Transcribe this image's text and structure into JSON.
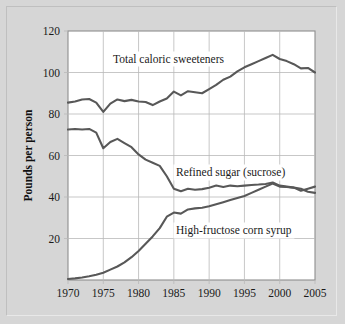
{
  "figure": {
    "background_color": "#d6d6d6",
    "plot_background_color": "#ffffff",
    "line_color": "#585858",
    "grid_color": "#b9b9b9",
    "frame_color": "#8e8e8e"
  },
  "axes": {
    "y_axis_title": "Pounds per person",
    "y_tick_labels": [
      "120",
      "100",
      "80",
      "60",
      "40",
      "20"
    ],
    "x_tick_labels": [
      "1970",
      "1975",
      "1980",
      "1985",
      "1990",
      "1995",
      "2000",
      "2005"
    ]
  },
  "series_labels": {
    "total": "Total caloric sweeteners",
    "sugar": "Refined sugar (sucrose)",
    "hfcs": "High-fructose corn syrup"
  },
  "chart_data": {
    "type": "line",
    "title": "",
    "xlabel": "",
    "ylabel": "Pounds per person",
    "xlim": [
      1970,
      2005
    ],
    "ylim": [
      0,
      120
    ],
    "grid": true,
    "legend_position": "inline-labels",
    "x_ticks": [
      1970,
      1975,
      1980,
      1985,
      1990,
      1995,
      2000,
      2005
    ],
    "y_ticks": [
      20,
      40,
      60,
      80,
      100,
      120
    ],
    "x": [
      1970,
      1971,
      1972,
      1973,
      1974,
      1975,
      1976,
      1977,
      1978,
      1979,
      1980,
      1981,
      1982,
      1983,
      1984,
      1985,
      1986,
      1987,
      1988,
      1989,
      1990,
      1991,
      1992,
      1993,
      1994,
      1995,
      1996,
      1997,
      1998,
      1999,
      2000,
      2001,
      2002,
      2003,
      2004,
      2005
    ],
    "series": [
      {
        "name": "Total caloric sweeteners",
        "values": [
          85.5,
          86.0,
          87.0,
          87.2,
          85.5,
          81.0,
          85.0,
          87.0,
          86.2,
          86.8,
          86.0,
          85.8,
          84.3,
          86.0,
          87.5,
          90.8,
          89.0,
          91.0,
          90.5,
          90.0,
          92.0,
          94.0,
          96.5,
          98.0,
          100.5,
          102.5,
          104.0,
          105.5,
          107.0,
          108.5,
          106.5,
          105.5,
          104.0,
          102.0,
          102.2,
          100.0
        ]
      },
      {
        "name": "Refined sugar (sucrose)",
        "values": [
          72.5,
          72.8,
          72.5,
          72.8,
          71.0,
          63.5,
          66.5,
          68.0,
          66.0,
          64.0,
          60.5,
          58.0,
          56.5,
          55.0,
          50.0,
          44.0,
          42.8,
          44.0,
          43.5,
          43.8,
          44.5,
          45.5,
          44.8,
          45.5,
          45.2,
          45.5,
          45.8,
          46.0,
          46.3,
          47.0,
          45.5,
          45.0,
          44.5,
          44.0,
          42.5,
          42.0
        ]
      },
      {
        "name": "High-fructose corn syrup",
        "values": [
          0.5,
          0.8,
          1.2,
          1.8,
          2.5,
          3.5,
          5.0,
          6.5,
          8.5,
          11.0,
          14.0,
          17.5,
          21.0,
          25.0,
          30.5,
          32.5,
          32.0,
          34.0,
          34.5,
          34.8,
          35.5,
          36.5,
          37.5,
          38.5,
          39.5,
          40.5,
          42.0,
          43.5,
          45.0,
          46.5,
          45.0,
          44.8,
          44.5,
          43.0,
          44.0,
          45.0
        ]
      }
    ]
  }
}
